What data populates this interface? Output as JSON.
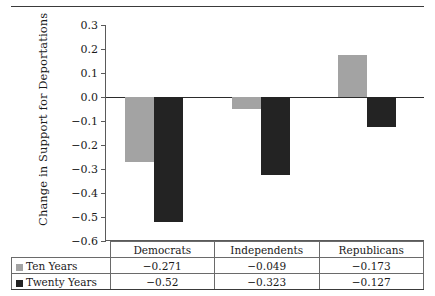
{
  "chart_data": {
    "type": "bar",
    "title": "",
    "xlabel": "",
    "ylabel": "Change in Support for Deportations",
    "categories": [
      "Democrats",
      "Independents",
      "Republicans"
    ],
    "series": [
      {
        "name": "Ten Years",
        "color": "#a3a3a3",
        "values": [
          -0.271,
          -0.049,
          -0.173
        ],
        "plotted_values": [
          -0.271,
          -0.049,
          0.173
        ]
      },
      {
        "name": "Twenty Years",
        "color": "#232323",
        "values": [
          -0.52,
          -0.323,
          -0.127
        ],
        "plotted_values": [
          -0.52,
          -0.323,
          -0.127
        ]
      }
    ],
    "ylim": [
      -0.6,
      0.3
    ],
    "ytick_labels": [
      "0.3",
      "0.2",
      "0.1",
      "0.0",
      "−0.1",
      "−0.2",
      "−0.3",
      "−0.4",
      "−0.5",
      "−0.6"
    ],
    "ytick_values": [
      0.3,
      0.2,
      0.1,
      0.0,
      -0.1,
      -0.2,
      -0.3,
      -0.4,
      -0.5,
      -0.6
    ],
    "grid": false,
    "legend_position": "table-left"
  },
  "table": {
    "category_row": [
      "Democrats",
      "Independents",
      "Republicans"
    ],
    "rows": [
      {
        "label": "Ten Years",
        "swatch": "#a3a3a3",
        "cells": [
          "−0.271",
          "−0.049",
          "−0.173"
        ]
      },
      {
        "label": "Twenty Years",
        "swatch": "#232323",
        "cells": [
          "−0.52",
          "−0.323",
          "−0.127"
        ]
      }
    ]
  }
}
